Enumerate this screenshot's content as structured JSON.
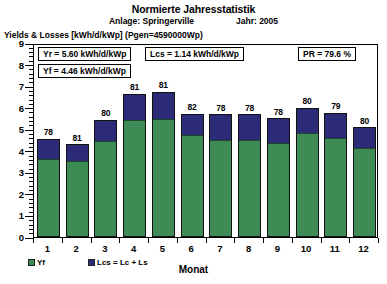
{
  "header": {
    "title": "Normierte Jahresstatistik",
    "plant_label": "Anlage: Springerville",
    "year_label": "Jahr: 2005",
    "axis_caption": "Yields & Losses [kWh/d/kWp] (Pgen=4590000Wp)"
  },
  "info_boxes": {
    "yr": "Yr = 5.60 kWh/d/kWp",
    "yf": "Yf = 4.46 kWh/d/kWp",
    "lcs": "Lcs = 1.14 kWh/d/kWp",
    "pr": "PR = 79.6 %"
  },
  "legend": {
    "yf_label": "Yf",
    "lcs_label": "Lcs = Lc + Ls",
    "yf_color": "#3e8b55",
    "lcs_color": "#2b2b78"
  },
  "chart_data": {
    "type": "bar",
    "title": "Normierte Jahresstatistik",
    "subtitle": "Anlage: Springerville    Jahr: 2005",
    "xlabel": "Monat",
    "ylabel": "Yields & Losses [kWh/d/kWp] (Pgen=4590000Wp)",
    "ylim": [
      0,
      9
    ],
    "yticks": [
      0,
      1,
      2,
      3,
      4,
      5,
      6,
      7,
      8,
      9
    ],
    "ytick_labels": [
      "0",
      "1",
      "2",
      "3",
      "4",
      "5",
      "6",
      "7",
      "8",
      "9"
    ],
    "minor_ticks_per_unit": 5,
    "grid": false,
    "stacked": true,
    "legend_position": "below-left",
    "categories": [
      "1",
      "2",
      "3",
      "4",
      "5",
      "6",
      "7",
      "8",
      "9",
      "10",
      "11",
      "12"
    ],
    "series": [
      {
        "name": "Yf",
        "color": "#3e8b55",
        "values": [
          3.58,
          3.48,
          4.42,
          5.4,
          5.45,
          4.7,
          4.45,
          4.45,
          4.3,
          4.8,
          4.55,
          4.08
        ]
      },
      {
        "name": "Lcs = Lc + Ls",
        "color": "#2b2b78",
        "values": [
          0.97,
          0.82,
          1.03,
          1.25,
          1.28,
          1.03,
          1.25,
          1.25,
          1.21,
          1.2,
          1.21,
          1.02
        ]
      }
    ],
    "totals": [
      4.55,
      4.3,
      5.45,
      6.65,
      6.73,
      5.73,
      5.7,
      5.7,
      5.51,
      6.0,
      5.76,
      5.1
    ],
    "bar_labels": [
      "78",
      "81",
      "80",
      "81",
      "81",
      "82",
      "78",
      "78",
      "78",
      "80",
      "79",
      "80"
    ],
    "bar_label_note": "Performance ratio per month in %",
    "annotations": [
      "Yr = 5.60 kWh/d/kWp",
      "Yf = 4.46 kWh/d/kWp",
      "Lcs = 1.14 kWh/d/kWp",
      "PR = 79.6 %"
    ]
  }
}
